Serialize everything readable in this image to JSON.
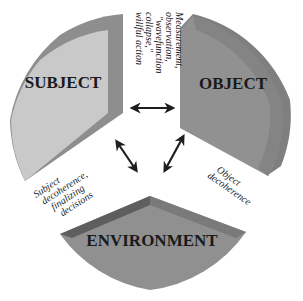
{
  "diagram": {
    "type": "three-segment circular cycle",
    "segments": [
      {
        "id": "subject",
        "label": "SUBJECT",
        "color": "#c9c9c9",
        "bevel_color": "#8e8e8e"
      },
      {
        "id": "object",
        "label": "OBJECT",
        "color": "#909090",
        "bevel_color": "#7e7e7e"
      },
      {
        "id": "environment",
        "label": "ENVIRONMENT",
        "color": "#8f8f8f",
        "bevel_color": "#6f6f6f"
      }
    ],
    "connections": [
      {
        "from": "subject",
        "to": "object",
        "bidirectional": true,
        "label_lines": [
          "Measurement,",
          "observation,",
          "\"wavefunction",
          "collapse,\"",
          "willful action"
        ]
      },
      {
        "from": "object",
        "to": "environment",
        "bidirectional": true,
        "label_lines": [
          "Object",
          "decoherence"
        ]
      },
      {
        "from": "subject",
        "to": "environment",
        "bidirectional": true,
        "label_lines": [
          "Subject",
          "decoherence,",
          "finalizing",
          "decisions"
        ]
      }
    ],
    "arrow_color": "#1e1e1e"
  }
}
